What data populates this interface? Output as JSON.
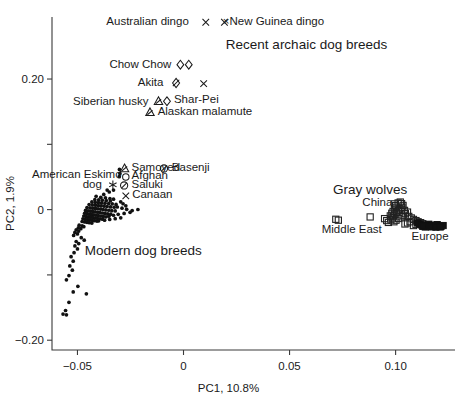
{
  "chart_data": {
    "type": "scatter",
    "title": "",
    "xlabel": "PC1, 10.8%",
    "ylabel": "PC2, 1.9%",
    "xlim": [
      -0.062,
      0.128
    ],
    "ylim": [
      -0.215,
      0.295
    ],
    "xticks": [
      -0.05,
      0,
      0.05,
      0.1
    ],
    "xticklabels": [
      "−0.05",
      "0",
      "0.05",
      "0.10"
    ],
    "yticks": [
      0.2,
      0.1,
      0,
      -0.1,
      -0.2
    ],
    "yticklabels": [
      "0.20",
      "",
      "0",
      "",
      "−0.20"
    ],
    "grid": false,
    "legend_position": "none",
    "group_annotations": [
      {
        "text": "Recent archaic dog breeds",
        "x": 0.058,
        "y": 0.253
      },
      {
        "text": "Modern dog breeds",
        "x": -0.019,
        "y": -0.062
      },
      {
        "text": "Gray wolves",
        "x": 0.088,
        "y": 0.032
      }
    ],
    "point_labels": [
      {
        "text": "Australian dingo",
        "x": 0.0025,
        "y": 0.289,
        "marker": "x",
        "marker_x": 0.0105,
        "marker_y": 0.287,
        "anchor": "end"
      },
      {
        "text": "×New Guinea dingo",
        "x": 0.0185,
        "y": 0.289,
        "marker": "x",
        "marker_x": 0.0193,
        "marker_y": 0.287,
        "anchor": "start"
      },
      {
        "text": "Chow Chow",
        "x": -0.0057,
        "y": 0.223,
        "marker": "diamond2",
        "marker_x": 0.0005,
        "marker_y": 0.222,
        "anchor": "end"
      },
      {
        "text": "Akita",
        "x": -0.0095,
        "y": 0.196,
        "marker": "diamond-slash",
        "marker_x": -0.0035,
        "marker_y": 0.194,
        "anchor": "end"
      },
      {
        "text": "",
        "x": 0.0095,
        "y": 0.193,
        "marker": "x",
        "marker_x": 0.0095,
        "marker_y": 0.193,
        "anchor": "start"
      },
      {
        "text": "Siberian husky",
        "x": -0.0165,
        "y": 0.167,
        "marker": "tri-slash",
        "marker_x": -0.0118,
        "marker_y": 0.166,
        "anchor": "end"
      },
      {
        "text": "Shar-Pei",
        "x": -0.0045,
        "y": 0.17,
        "marker": "diamond",
        "marker_x": -0.0078,
        "marker_y": 0.166,
        "anchor": "start"
      },
      {
        "text": "Alaskan malamute",
        "x": -0.0122,
        "y": 0.151,
        "marker": "tri-slash",
        "marker_x": -0.0158,
        "marker_y": 0.149,
        "anchor": "start"
      },
      {
        "text": "Samoyed",
        "x": -0.0245,
        "y": 0.066,
        "marker": "tri-slash",
        "marker_x": -0.0278,
        "marker_y": 0.063,
        "anchor": "start"
      },
      {
        "text": "Basenji",
        "x": -0.0055,
        "y": 0.066,
        "marker": "circ-slash",
        "marker_x": -0.0092,
        "marker_y": 0.063,
        "anchor": "start"
      },
      {
        "text": "American Eskimo",
        "x": -0.0292,
        "y": 0.054,
        "marker": "none",
        "marker_x": 0,
        "marker_y": 0,
        "anchor": "end"
      },
      {
        "text": "Afghan",
        "x": -0.0245,
        "y": 0.053,
        "marker": "circle",
        "marker_x": -0.0272,
        "marker_y": 0.05,
        "anchor": "start"
      },
      {
        "text": "dog",
        "x": -0.0385,
        "y": 0.039,
        "marker": "asterisk",
        "marker_x": -0.0333,
        "marker_y": 0.038,
        "anchor": "end"
      },
      {
        "text": "Saluki",
        "x": -0.0245,
        "y": 0.039,
        "marker": "circ-slash",
        "marker_x": -0.028,
        "marker_y": 0.037,
        "anchor": "start"
      },
      {
        "text": "Canaan",
        "x": -0.0242,
        "y": 0.024,
        "marker": "x",
        "marker_x": -0.0272,
        "marker_y": 0.021,
        "anchor": "start"
      },
      {
        "text": "China",
        "x": 0.0985,
        "y": 0.012,
        "marker": "none",
        "marker_x": 0,
        "marker_y": 0,
        "anchor": "end"
      },
      {
        "text": "Middle East",
        "x": 0.0935,
        "y": -0.029,
        "marker": "none",
        "marker_x": 0,
        "marker_y": 0,
        "anchor": "end"
      },
      {
        "text": "Europe",
        "x": 0.1075,
        "y": -0.04,
        "marker": "none",
        "marker_x": 0,
        "marker_y": 0,
        "anchor": "start"
      }
    ],
    "series": [
      {
        "name": "Modern dog breeds",
        "marker": "filled-dot",
        "points": [
          [
            -0.0302,
            0.0615
          ],
          [
            -0.03,
            0.0555
          ],
          [
            -0.0303,
            0.0505
          ],
          [
            -0.036,
            0.03
          ],
          [
            -0.0376,
            0.0232
          ],
          [
            -0.0412,
            0.0205
          ],
          [
            -0.039,
            0.0188
          ],
          [
            -0.0368,
            0.0182
          ],
          [
            -0.0347,
            0.017
          ],
          [
            -0.033,
            0.016
          ],
          [
            -0.0418,
            0.0152
          ],
          [
            -0.04,
            0.0148
          ],
          [
            -0.0383,
            0.0145
          ],
          [
            -0.0364,
            0.014
          ],
          [
            -0.0345,
            0.0132
          ],
          [
            -0.0432,
            0.0118
          ],
          [
            -0.0416,
            0.0112
          ],
          [
            -0.0401,
            0.0108
          ],
          [
            -0.0386,
            0.0102
          ],
          [
            -0.037,
            0.0098
          ],
          [
            -0.0353,
            0.0092
          ],
          [
            -0.0336,
            0.0088
          ],
          [
            -0.0318,
            0.008
          ],
          [
            -0.0445,
            0.0078
          ],
          [
            -0.043,
            0.0072
          ],
          [
            -0.0415,
            0.0068
          ],
          [
            -0.0401,
            0.0062
          ],
          [
            -0.0388,
            0.0058
          ],
          [
            -0.0374,
            0.0052
          ],
          [
            -0.036,
            0.0048
          ],
          [
            -0.0344,
            0.0042
          ],
          [
            -0.0327,
            0.0036
          ],
          [
            -0.0455,
            0.0032
          ],
          [
            -0.0441,
            0.0028
          ],
          [
            -0.0428,
            0.0022
          ],
          [
            -0.0415,
            0.0018
          ],
          [
            -0.0403,
            0.0012
          ],
          [
            -0.0391,
            0.0008
          ],
          [
            -0.0379,
            0.0002
          ],
          [
            -0.0366,
            -0.0004
          ],
          [
            -0.0352,
            -0.001
          ],
          [
            -0.0338,
            -0.0016
          ],
          [
            -0.0322,
            -0.002
          ],
          [
            -0.0462,
            -0.0012
          ],
          [
            -0.045,
            -0.0018
          ],
          [
            -0.0438,
            -0.0024
          ],
          [
            -0.0427,
            -0.003
          ],
          [
            -0.0416,
            -0.0035
          ],
          [
            -0.0405,
            -0.004
          ],
          [
            -0.0394,
            -0.0046
          ],
          [
            -0.0382,
            -0.0052
          ],
          [
            -0.037,
            -0.0058
          ],
          [
            -0.0357,
            -0.0063
          ],
          [
            -0.0343,
            -0.007
          ],
          [
            -0.0466,
            -0.0056
          ],
          [
            -0.0455,
            -0.0062
          ],
          [
            -0.0444,
            -0.0068
          ],
          [
            -0.0434,
            -0.0074
          ],
          [
            -0.0424,
            -0.008
          ],
          [
            -0.0413,
            -0.0086
          ],
          [
            -0.0402,
            -0.0092
          ],
          [
            -0.039,
            -0.0098
          ],
          [
            -0.0378,
            -0.0104
          ],
          [
            -0.0365,
            -0.011
          ],
          [
            -0.047,
            -0.0098
          ],
          [
            -0.0459,
            -0.0104
          ],
          [
            -0.0448,
            -0.011
          ],
          [
            -0.0438,
            -0.0116
          ],
          [
            -0.0428,
            -0.0122
          ],
          [
            -0.0417,
            -0.0128
          ],
          [
            -0.0406,
            -0.0134
          ],
          [
            -0.0394,
            -0.014
          ],
          [
            -0.0382,
            -0.0146
          ],
          [
            -0.0474,
            -0.014
          ],
          [
            -0.0463,
            -0.0146
          ],
          [
            -0.0452,
            -0.0152
          ],
          [
            -0.0442,
            -0.0158
          ],
          [
            -0.0431,
            -0.0164
          ],
          [
            -0.042,
            -0.017
          ],
          [
            -0.0408,
            -0.0176
          ],
          [
            -0.0478,
            -0.0182
          ],
          [
            -0.0466,
            -0.0188
          ],
          [
            -0.0455,
            -0.0194
          ],
          [
            -0.0444,
            -0.02
          ],
          [
            -0.0432,
            -0.0206
          ],
          [
            -0.0312,
            0.004
          ],
          [
            -0.029,
            0.0022
          ],
          [
            -0.0268,
            0.0004
          ],
          [
            -0.0242,
            -0.0014
          ],
          [
            -0.0215,
            0.0002
          ],
          [
            -0.0252,
            -0.0042
          ],
          [
            -0.028,
            -0.0058
          ],
          [
            -0.0308,
            -0.0072
          ],
          [
            -0.033,
            -0.0086
          ],
          [
            -0.0352,
            -0.01
          ],
          [
            -0.0296,
            -0.0126
          ],
          [
            -0.0322,
            -0.0138
          ],
          [
            -0.0348,
            -0.015
          ],
          [
            -0.0372,
            -0.0162
          ],
          [
            -0.04,
            -0.0172
          ],
          [
            -0.0492,
            -0.0238
          ],
          [
            -0.0478,
            -0.025
          ],
          [
            -0.047,
            -0.0262
          ],
          [
            -0.0496,
            -0.028
          ],
          [
            -0.0484,
            -0.0292
          ],
          [
            -0.0506,
            -0.031
          ],
          [
            -0.0494,
            -0.0328
          ],
          [
            -0.0512,
            -0.035
          ],
          [
            -0.05,
            -0.0372
          ],
          [
            -0.0518,
            -0.0396
          ],
          [
            -0.0482,
            -0.043
          ],
          [
            -0.0468,
            -0.0468
          ],
          [
            -0.0506,
            -0.0488
          ],
          [
            -0.0494,
            -0.052
          ],
          [
            -0.0512,
            -0.0556
          ],
          [
            -0.05,
            -0.0602
          ],
          [
            -0.0516,
            -0.066
          ],
          [
            -0.053,
            -0.072
          ],
          [
            -0.052,
            -0.079
          ],
          [
            -0.0536,
            -0.0862
          ],
          [
            -0.0524,
            -0.0928
          ],
          [
            -0.054,
            -0.101
          ],
          [
            -0.0552,
            -0.1075
          ],
          [
            -0.0498,
            -0.1175
          ],
          [
            -0.052,
            -0.126
          ],
          [
            -0.0458,
            -0.129
          ],
          [
            -0.054,
            -0.142
          ],
          [
            -0.0556,
            -0.1545
          ],
          [
            -0.0568,
            -0.16
          ],
          [
            -0.0552,
            -0.1612
          ],
          [
            -0.033,
            0.03
          ],
          [
            -0.035,
            0.027
          ],
          [
            -0.0296,
            0.012
          ],
          [
            -0.0285,
            0.009
          ],
          [
            -0.0272,
            0.0058
          ]
        ]
      },
      {
        "name": "Gray wolves",
        "marker": "open-square",
        "points": [
          [
            0.0718,
            -0.0148
          ],
          [
            0.073,
            -0.0162
          ],
          [
            0.088,
            -0.0112
          ],
          [
            0.0948,
            -0.0138
          ],
          [
            0.0958,
            -0.0168
          ],
          [
            0.0966,
            -0.0196
          ],
          [
            0.0975,
            -0.0096
          ],
          [
            0.0982,
            -0.0056
          ],
          [
            0.0988,
            -0.0028
          ],
          [
            0.0996,
            0.0008
          ],
          [
            0.1002,
            0.0036
          ],
          [
            0.1,
            0.0062
          ],
          [
            0.0994,
            0.0088
          ],
          [
            0.1012,
            0.0102
          ],
          [
            0.1022,
            0.0116
          ],
          [
            0.1028,
            0.0092
          ],
          [
            0.1035,
            0.0064
          ],
          [
            0.103,
            0.0036
          ],
          [
            0.102,
            0.0012
          ],
          [
            0.1012,
            -0.0016
          ],
          [
            0.1004,
            -0.0044
          ],
          [
            0.0996,
            -0.0072
          ],
          [
            0.099,
            -0.01
          ],
          [
            0.0984,
            -0.0128
          ],
          [
            0.0978,
            -0.0156
          ],
          [
            0.1042,
            -0.0012
          ],
          [
            0.1056,
            -0.0038
          ],
          [
            0.1046,
            -0.0062
          ],
          [
            0.1036,
            -0.0086
          ],
          [
            0.1026,
            -0.011
          ],
          [
            0.1014,
            -0.0136
          ],
          [
            0.1002,
            -0.0162
          ],
          [
            0.0992,
            -0.0186
          ],
          [
            0.1062,
            -0.0104
          ],
          [
            0.1074,
            -0.0128
          ],
          [
            0.1084,
            -0.015
          ],
          [
            0.1096,
            -0.0168
          ],
          [
            0.1068,
            -0.0186
          ],
          [
            0.1056,
            -0.0204
          ],
          [
            0.1044,
            -0.022
          ],
          [
            0.1106,
            -0.0186
          ],
          [
            0.1118,
            -0.02
          ],
          [
            0.1128,
            -0.0216
          ],
          [
            0.1096,
            -0.0228
          ],
          [
            0.1084,
            -0.0244
          ]
        ]
      },
      {
        "name": "Gray wolves (filled)",
        "marker": "filled-square",
        "points": [
          [
            0.1104,
            -0.0206
          ],
          [
            0.1114,
            -0.0222
          ],
          [
            0.1124,
            -0.0236
          ],
          [
            0.1136,
            -0.0248
          ],
          [
            0.1146,
            -0.0238
          ],
          [
            0.1156,
            -0.0224
          ],
          [
            0.1166,
            -0.024
          ],
          [
            0.1176,
            -0.0252
          ],
          [
            0.1186,
            -0.0242
          ],
          [
            0.1196,
            -0.023
          ],
          [
            0.1204,
            -0.0246
          ],
          [
            0.1214,
            -0.0256
          ],
          [
            0.1224,
            -0.0244
          ],
          [
            0.1152,
            -0.0258
          ],
          [
            0.117,
            -0.0264
          ],
          [
            0.119,
            -0.0268
          ],
          [
            0.121,
            -0.0266
          ],
          [
            0.114,
            -0.0266
          ],
          [
            0.1128,
            -0.0256
          ]
        ]
      }
    ]
  }
}
